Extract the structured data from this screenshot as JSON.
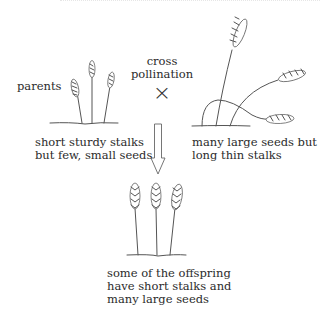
{
  "diagram": {
    "title": "",
    "labels": {
      "parents": "parents",
      "cross_line1": "cross",
      "cross_line2": "pollination",
      "cross_symbol": "×",
      "left_parent_line1": "short sturdy stalks",
      "left_parent_line2": "but few, small seeds",
      "right_parent_line1": "many large seeds but",
      "right_parent_line2": "long thin stalks",
      "offspring_line1": "some of the offspring",
      "offspring_line2": "have short stalks and",
      "offspring_line3": "many large seeds"
    },
    "nodes": [
      {
        "id": "left-parent",
        "description": "three short sturdy wheat stalks with small ears"
      },
      {
        "id": "right-parent",
        "description": "three long thin wheat stalks with large ears, drooping"
      },
      {
        "id": "offspring",
        "description": "three short stalks with large ears"
      }
    ],
    "edges": [
      {
        "from": "left-parent",
        "to": "right-parent",
        "label": "cross pollination",
        "symbol": "×"
      },
      {
        "from": "parents",
        "to": "offspring",
        "type": "hollow-down-arrow"
      }
    ],
    "colors": {
      "line": "#555555",
      "text": "#2b2b2b",
      "background": "#ffffff"
    }
  }
}
